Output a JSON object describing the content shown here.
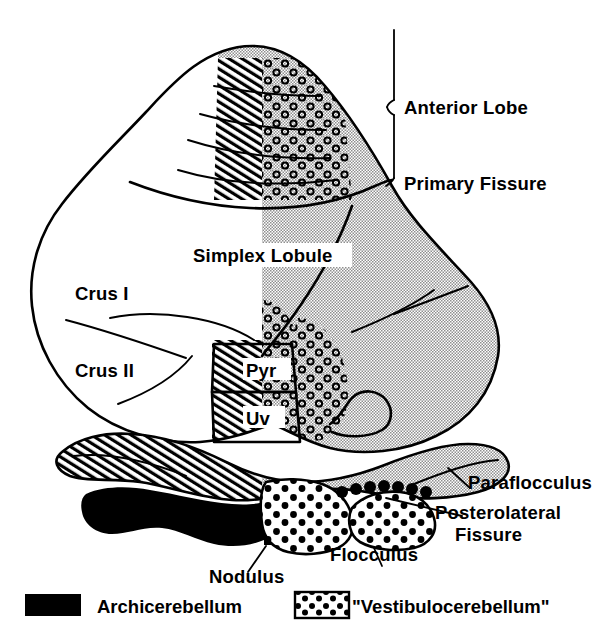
{
  "figure": {
    "title_alt": "Flattened schematic of the cerebellar cortex",
    "labels": {
      "anterior_lobe": "Anterior Lobe",
      "primary_fissure": "Primary Fissure",
      "simplex_lobule": "Simplex Lobule",
      "crus_i": "Crus I",
      "crus_ii": "Crus II",
      "pyramis": "Pyr",
      "uvula": "Uv",
      "paraflocculus": "Paraflocculus",
      "posterolateral_fissure_line1": "Posterolateral",
      "posterolateral_fissure_line2": "Fissure",
      "flocculus": "Flocculus",
      "nodulus": "Nodulus"
    },
    "legend": [
      {
        "key": "archicerebellum",
        "label": "Archicerebellum",
        "swatch": "solid-black"
      },
      {
        "key": "vestibulocerebellum",
        "label": "\"Vestibulocerebellum\"",
        "swatch": "white-with-black-dots"
      }
    ],
    "colors": {
      "ink": "#000000",
      "page": "#ffffff",
      "halftone_gray": "#c9c9c9",
      "archicerebellum_fill": "#000000"
    },
    "patterns": {
      "hemisphere_shading": "fine checkerboard halftone gray",
      "paravermis_band": "diagonal line hatching",
      "vermis_stipple": "small open circles",
      "vestibulocerebellum": "large solid black dots on white",
      "archicerebellum": "solid black"
    }
  }
}
